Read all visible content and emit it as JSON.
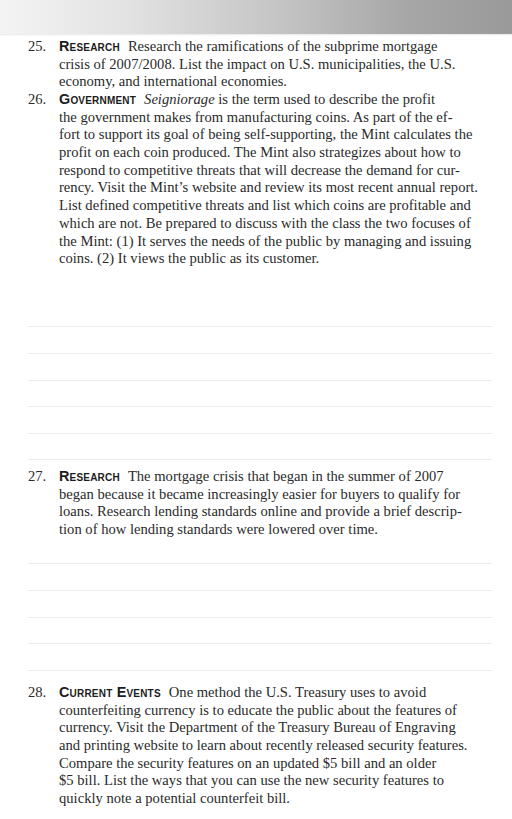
{
  "header": {
    "band": "gradient-header-band"
  },
  "exercises": [
    {
      "number": "25.",
      "category": "Research",
      "lines": [
        "Research the ramifications of the subprime mortgage",
        "crisis of 2007/2008. List the impact on U.S. municipalities, the U.S.",
        "economy, and international economies."
      ],
      "answer_lines": 0
    },
    {
      "number": "26.",
      "category": "Government",
      "first_line_italic": "Seigniorage",
      "first_line_rest": " is the term used to describe the profit",
      "lines": [
        "the government makes from manufacturing coins. As part of the ef-",
        "fort to support its goal of being self-supporting, the Mint calculates the",
        "profit on each coin produced. The Mint also strategizes about how to",
        "respond to competitive threats that will decrease the demand for cur-",
        "rency. Visit the Mint’s website and review its most recent annual report.",
        "List defined competitive threats and list which coins are profitable and",
        "which are not. Be prepared to discuss with the class the two focuses of",
        "the Mint: (1) It serves the needs of the public by managing and issuing",
        "coins. (2) It views the public as its customer."
      ],
      "answer_lines": 6
    },
    {
      "number": "27.",
      "category": "Research",
      "lines": [
        "The mortgage crisis that began in the summer of 2007",
        "began because it became increasingly easier for buyers to qualify for",
        "loans. Research lending standards online and provide a brief descrip-",
        "tion of how lending standards were lowered over time."
      ],
      "answer_lines": 5
    },
    {
      "number": "28.",
      "category": "Current Events",
      "lines": [
        "One method the U.S. Treasury uses to avoid",
        "counterfeiting currency is to educate the public about the features of",
        "currency. Visit the Department of the Treasury Bureau of Engraving",
        "and printing website to learn about recently released security features.",
        "Compare the security features on an updated $5 bill and an older",
        "$5 bill. List the ways that you can use the new security features to",
        "quickly note a potential counterfeit bill."
      ],
      "answer_lines": 0
    }
  ],
  "colors": {
    "text": "#2a2a2a",
    "category": "#1c1c1c",
    "rule": "#ececec",
    "band_left": "#f4f4f4",
    "band_right": "#9a9a9a"
  }
}
